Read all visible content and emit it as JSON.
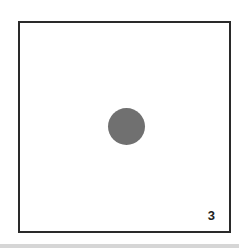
{
  "card": {
    "number": "3",
    "dot_color": "#707070",
    "border_color": "#2a2a2a"
  }
}
